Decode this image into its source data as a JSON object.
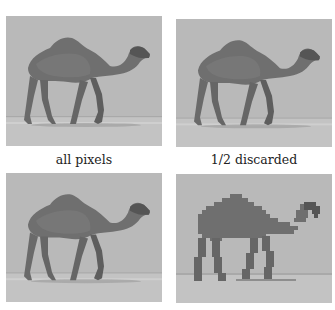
{
  "figure": {
    "panels": [
      {
        "id": "top-left",
        "caption": "all pixels",
        "subject": "camel photo",
        "rendering": "full resolution"
      },
      {
        "id": "top-right",
        "caption": "1/2 discarded",
        "subject": "camel photo",
        "rendering": "half pixels discarded"
      },
      {
        "id": "bottom-left",
        "caption": "",
        "subject": "camel photo",
        "rendering": "slightly reduced"
      },
      {
        "id": "bottom-right",
        "caption": "",
        "subject": "camel photo",
        "rendering": "pixelated / blocky"
      }
    ],
    "colors": {
      "background": "#ffffff",
      "sky": "#b9b9b9",
      "ground": "#c4c4c4",
      "camel_body": "#6e6e6e",
      "camel_dark": "#555555",
      "caption_text": "#222222"
    }
  }
}
